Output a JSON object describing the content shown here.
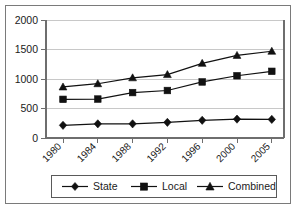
{
  "chart_data": {
    "type": "line",
    "title": "",
    "xlabel": "",
    "ylabel": "",
    "categories": [
      "1980",
      "1984",
      "1988",
      "1992",
      "1996",
      "2000",
      "2005"
    ],
    "series": [
      {
        "name": "State",
        "marker": "diamond",
        "values": [
          215,
          240,
          240,
          265,
          300,
          320,
          315
        ]
      },
      {
        "name": "Local",
        "marker": "square",
        "values": [
          655,
          660,
          770,
          805,
          950,
          1055,
          1130
        ]
      },
      {
        "name": "Combined",
        "marker": "triangle",
        "values": [
          865,
          920,
          1020,
          1075,
          1265,
          1400,
          1470
        ]
      }
    ],
    "yticks": [
      0,
      500,
      1000,
      1500,
      2000
    ],
    "ytick_labels": [
      "0",
      "500",
      "1000",
      "1500",
      "2000"
    ],
    "ylim": [
      0,
      2000
    ],
    "grid": "horizontal",
    "legend_position": "bottom",
    "colors": {
      "series": "#111111",
      "gridline": "#c8c8c8",
      "axis": "#6e6e6e",
      "frame": "#7a7a7a",
      "background": "#ffffff",
      "text": "#1a1a1a"
    }
  },
  "legend": {
    "items": [
      {
        "label": "State"
      },
      {
        "label": "Local"
      },
      {
        "label": "Combined"
      }
    ]
  },
  "axes": {
    "y_labels": [
      "2000",
      "1500",
      "1000",
      "500",
      "0"
    ],
    "x_labels": [
      "1980",
      "1984",
      "1988",
      "1992",
      "1996",
      "2000",
      "2005"
    ]
  }
}
